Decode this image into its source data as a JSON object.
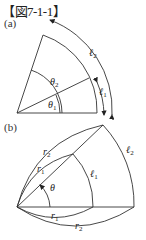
{
  "figure": {
    "title": "【図7-1-1】",
    "panel_a": {
      "label": "(a)",
      "theta1": "θ",
      "theta1_sub": "1",
      "theta2": "θ",
      "theta2_sub": "2",
      "l1": "ℓ",
      "l1_sub": "1",
      "l2": "ℓ",
      "l2_sub": "2"
    },
    "panel_b": {
      "label": "(b)",
      "theta": "θ",
      "r1_top": "r",
      "r1_top_sub": "1",
      "r2_top": "r",
      "r2_top_sub": "2",
      "r1_bottom": "r",
      "r1_bottom_sub": "1",
      "r2_bottom": "r",
      "r2_bottom_sub": "2",
      "l1": "ℓ",
      "l1_sub": "1",
      "l2": "ℓ",
      "l2_sub": "2"
    },
    "colors": {
      "line": "#333333",
      "background": "#ffffff"
    }
  }
}
